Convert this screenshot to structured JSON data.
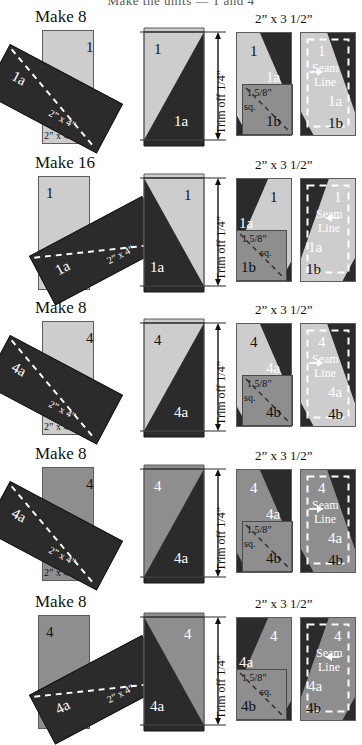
{
  "document": {
    "clipped_header": "Make the units — 1 and 4",
    "type": "quilting-piecing-instruction-diagram"
  },
  "labels": {
    "strip_size": "2” x 4”",
    "trimmed_size": "2” x 3 1/2”",
    "trim_note": "Trim off 1/4”",
    "seam_line": "Seam\nLine",
    "seam_line_l1": "Seam",
    "seam_line_l2": "Line",
    "square_size_l1": "1 5/8”",
    "square_size_l2": "sq."
  },
  "rows": [
    {
      "id": "row-1",
      "make": "Make 8",
      "dim_top": "2” x 3 1/2”",
      "base_label": "1",
      "patch_label": "1a",
      "corner_label": "1b",
      "base_shade": "light",
      "mirrored": false,
      "strip_label_a": "2” x 4”",
      "strip_label_b": "2” x 4”"
    },
    {
      "id": "row-2",
      "make": "Make 16",
      "dim_top": "2” x 3 1/2”",
      "base_label": "1",
      "patch_label": "1a",
      "corner_label": "1b",
      "base_shade": "light",
      "mirrored": true,
      "strip_label_a": "2” x 4”",
      "strip_label_b": "2” x 4”"
    },
    {
      "id": "row-3",
      "make": "Make 8",
      "dim_top": "2” x 3 1/2”",
      "base_label": "4",
      "patch_label": "4a",
      "corner_label": "4b",
      "base_shade": "light",
      "mirrored": false,
      "strip_label_a": "2” x 4”",
      "strip_label_b": "2” x 4”"
    },
    {
      "id": "row-4",
      "make": "Make 8",
      "dim_top": "2” x 3 1/2”",
      "base_label": "4",
      "patch_label": "4a",
      "corner_label": "4b",
      "base_shade": "medium",
      "mirrored": false,
      "strip_label_a": "2” x 4”",
      "strip_label_b": "2” x 4”"
    },
    {
      "id": "row-5",
      "make": "Make 8",
      "dim_top": "2” x 3 1/2”",
      "base_label": "4",
      "patch_label": "4a",
      "corner_label": "4b",
      "base_shade": "medium",
      "mirrored": true,
      "strip_label_a": "2” x 4”",
      "strip_label_b": "2” x 4”"
    }
  ],
  "colors": {
    "light_fabric": "#cdcdcd",
    "medium_fabric": "#8e8e8e",
    "dark_fabric": "#2b2b2b",
    "outline": "#5d5d5d",
    "paper": "#ffffff"
  }
}
